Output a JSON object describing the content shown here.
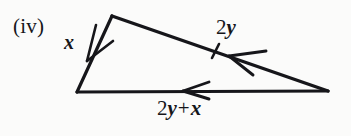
{
  "figure": {
    "enumeration_label": "(iv)",
    "background_color": "#fbfbfa",
    "ink_color": "#16161a",
    "width": 351,
    "height": 136,
    "shape": "triangle"
  },
  "vertices": {
    "apex": {
      "name": "apex",
      "x": 112,
      "y": 16
    },
    "bottom_left": {
      "name": "bottom-left",
      "x": 77,
      "y": 92
    },
    "bottom_right": {
      "name": "bottom-right",
      "x": 328,
      "y": 91
    }
  },
  "sides": [
    {
      "id": "left-side",
      "label_parts": {
        "coefficient": "",
        "variable": "x",
        "operator": "",
        "variable2": ""
      },
      "label_text": "x",
      "from": "apex",
      "to": "bottom_left",
      "arrow_direction": "down-left",
      "tick_marks": 0
    },
    {
      "id": "right-side",
      "label_parts": {
        "coefficient": "2",
        "variable": "y",
        "operator": "",
        "variable2": ""
      },
      "label_text": "2y",
      "from": "bottom_right",
      "to": "apex",
      "arrow_direction": "up-left",
      "tick_marks": 1
    },
    {
      "id": "bottom-side",
      "label_parts": {
        "coefficient": "2",
        "variable": "y",
        "operator": "+",
        "variable2": "x"
      },
      "label_text": "2y + x",
      "from": "bottom_right",
      "to": "bottom_left",
      "arrow_direction": "left",
      "tick_marks": 0
    }
  ]
}
